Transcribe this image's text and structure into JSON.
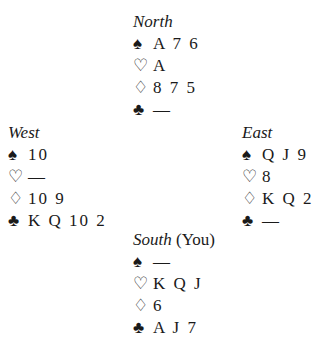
{
  "hands": {
    "north": {
      "name": "North",
      "extra": "",
      "spades": "A 7 6",
      "hearts": "A",
      "diamonds": "8 7 5",
      "clubs": "—"
    },
    "west": {
      "name": "West",
      "extra": "",
      "spades": "10",
      "hearts": "—",
      "diamonds": "10 9",
      "clubs": "K Q 10 2"
    },
    "east": {
      "name": "East",
      "extra": "",
      "spades": "Q J 9",
      "hearts": "8",
      "diamonds": "K Q 2",
      "clubs": "—"
    },
    "south": {
      "name": "South",
      "extra": " (You)",
      "spades": "—",
      "hearts": "K Q J",
      "diamonds": "6",
      "clubs": "A J 7"
    }
  },
  "suits": {
    "spades": "♠",
    "hearts": "♡",
    "diamonds": "♢",
    "clubs": "♣"
  }
}
